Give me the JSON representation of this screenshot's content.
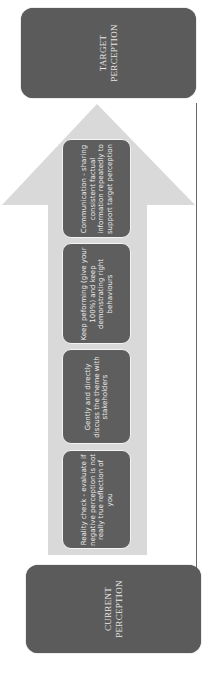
{
  "diagram": {
    "type": "progression-arrow",
    "orientation": "rotated-90-ccw",
    "target": {
      "label": "TARGET\nPERCEPTION"
    },
    "current": {
      "label": "CURRENT\nPERCEPTION"
    },
    "steps": [
      {
        "label": "Communication - sharing consistent factual information repeatedly to support target perception"
      },
      {
        "label": "Keep peforming (give your 100%) and keep demonstrating right behaviours"
      },
      {
        "label": "Gently and directly discuss the theme with stakeholders"
      },
      {
        "label": "Reality check - evaluate if negative perception is not really true reflection of you"
      }
    ],
    "colors": {
      "box_fill": "#5b5b5b",
      "arrow_fill": "#d9d9d9",
      "text": "#ededed",
      "line": "#6a6a6a"
    }
  }
}
